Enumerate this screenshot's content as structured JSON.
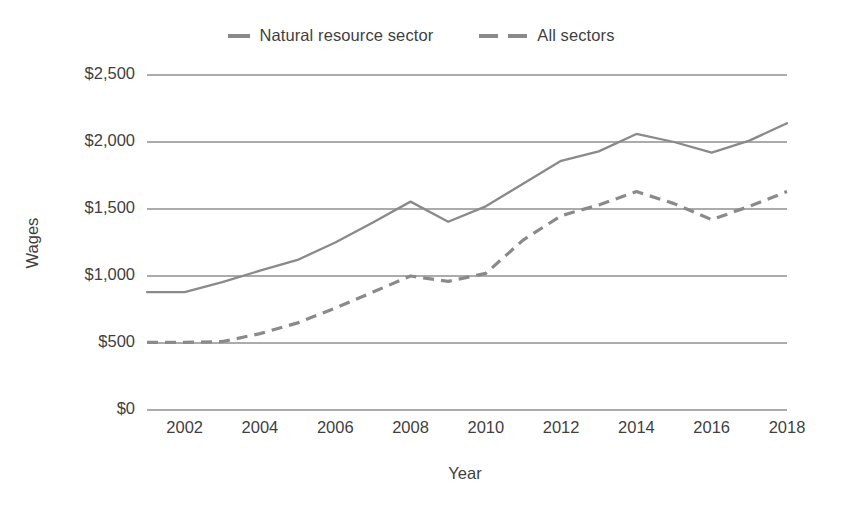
{
  "chart_data": {
    "type": "line",
    "title": "",
    "xlabel": "Year",
    "ylabel": "Wages",
    "x": [
      2001,
      2002,
      2003,
      2004,
      2005,
      2006,
      2007,
      2008,
      2009,
      2010,
      2011,
      2012,
      2013,
      2014,
      2015,
      2016,
      2017,
      2018
    ],
    "xlim": [
      2001,
      2018
    ],
    "ylim": [
      0,
      2500
    ],
    "xticks": [
      2002,
      2004,
      2006,
      2008,
      2010,
      2012,
      2014,
      2016,
      2018
    ],
    "xtick_labels": [
      "2002",
      "2004",
      "2006",
      "2008",
      "2010",
      "2012",
      "2014",
      "2016",
      "2018"
    ],
    "yticks": [
      0,
      500,
      1000,
      1500,
      2000,
      2500
    ],
    "ytick_labels": [
      "$0",
      "$500",
      "$1,000",
      "$1,500",
      "$2,000",
      "$2,500"
    ],
    "grid": "horizontal",
    "legend_position": "top-center",
    "series": [
      {
        "name": "Natural resource sector",
        "style": "solid",
        "color": "#8a8a8a",
        "values": [
          880,
          880,
          955,
          1040,
          1120,
          1250,
          1400,
          1555,
          1405,
          1520,
          1690,
          1860,
          1930,
          2060,
          2000,
          1920,
          2010,
          2140
        ]
      },
      {
        "name": "All sectors",
        "style": "dashed",
        "color": "#8a8a8a",
        "values": [
          505,
          505,
          510,
          570,
          650,
          760,
          880,
          1000,
          960,
          1020,
          1270,
          1450,
          1530,
          1630,
          1540,
          1420,
          1520,
          1630
        ]
      }
    ]
  },
  "legend": {
    "entries": [
      {
        "label": "Natural resource sector",
        "marker": "solid-line-swatch"
      },
      {
        "label": "All sectors",
        "marker": "dashed-line-swatch"
      }
    ]
  },
  "axes": {
    "x_title": "Year",
    "y_title": "Wages"
  }
}
